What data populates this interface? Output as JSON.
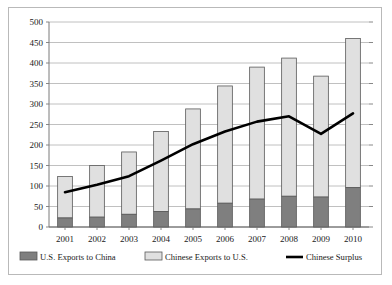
{
  "chart_data": {
    "type": "bar",
    "subtype": "stacked-bar-with-line",
    "title": "",
    "xlabel": "",
    "ylabel": "",
    "categories": [
      "2001",
      "2002",
      "2003",
      "2004",
      "2005",
      "2006",
      "2007",
      "2008",
      "2009",
      "2010"
    ],
    "ylim": [
      0,
      500
    ],
    "ytick_step": 50,
    "yticks": [
      0,
      50,
      100,
      150,
      200,
      250,
      300,
      350,
      400,
      450,
      500
    ],
    "ytick_labels": [
      "0",
      "50",
      "100",
      "150",
      "200",
      "250",
      "300",
      "350",
      "400",
      "450",
      "500"
    ],
    "grid": true,
    "grid_axis": "y",
    "legend_position": "bottom",
    "series": [
      {
        "name": "U.S. Exports to China",
        "type": "bar-segment",
        "color": "#7f7f7f",
        "values": [
          22,
          24,
          31,
          38,
          44,
          58,
          68,
          75,
          73,
          96
        ]
      },
      {
        "name": "Chinese Exports to U.S.",
        "type": "bar-segment",
        "color": "#e0e0e0",
        "values": [
          101,
          126,
          152,
          195,
          244,
          286,
          322,
          337,
          295,
          364
        ]
      },
      {
        "name": "Chinese Surplus",
        "type": "line",
        "color": "#000000",
        "values": [
          85,
          103,
          124,
          162,
          202,
          233,
          257,
          270,
          227,
          277
        ]
      }
    ],
    "stacked_totals": [
      123,
      150,
      183,
      233,
      288,
      344,
      390,
      412,
      368,
      460
    ]
  },
  "legend": {
    "items": [
      {
        "label": "U.S. Exports to China",
        "marker": "filled-gray-swatch"
      },
      {
        "label": "Chinese Exports to U.S.",
        "marker": "light-gray-swatch"
      },
      {
        "label": "Chinese Surplus",
        "marker": "black-line-swatch"
      }
    ]
  },
  "axis": {
    "y_labels": [
      "500",
      "450",
      "400",
      "350",
      "300",
      "250",
      "200",
      "150",
      "100",
      "50",
      "0"
    ],
    "x_labels": [
      "2001",
      "2002",
      "2003",
      "2004",
      "2005",
      "2006",
      "2007",
      "2008",
      "2009",
      "2010"
    ]
  },
  "colors": {
    "bar_dark": "#7f7f7f",
    "bar_light": "#e0e0e0",
    "bar_stroke": "#595959",
    "line": "#000000",
    "grid": "#b0b0b0",
    "axis": "#7a7a7a",
    "frame": "#b9b9b9",
    "text": "#1a1a1a"
  }
}
